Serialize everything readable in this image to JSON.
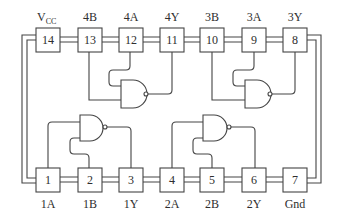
{
  "diagram": {
    "colors": {
      "line": "#444444",
      "text": "#2e2e2e",
      "background": "#ffffff"
    },
    "top_pins": [
      {
        "number": "14",
        "label": "V",
        "label_sub": "CC"
      },
      {
        "number": "13",
        "label": "4B"
      },
      {
        "number": "12",
        "label": "4A"
      },
      {
        "number": "11",
        "label": "4Y"
      },
      {
        "number": "10",
        "label": "3B"
      },
      {
        "number": "9",
        "label": "3A"
      },
      {
        "number": "8",
        "label": "3Y"
      }
    ],
    "bottom_pins": [
      {
        "number": "1",
        "label": "1A"
      },
      {
        "number": "2",
        "label": "1B"
      },
      {
        "number": "3",
        "label": "1Y"
      },
      {
        "number": "4",
        "label": "2A"
      },
      {
        "number": "5",
        "label": "2B"
      },
      {
        "number": "6",
        "label": "2Y"
      },
      {
        "number": "7",
        "label": "Gnd"
      }
    ],
    "gates": [
      {
        "name": "gate-1",
        "type": "NAND",
        "inputs": [
          "1",
          "2"
        ],
        "output": "3"
      },
      {
        "name": "gate-2",
        "type": "NAND",
        "inputs": [
          "4",
          "5"
        ],
        "output": "6"
      },
      {
        "name": "gate-3",
        "type": "NAND",
        "inputs": [
          "9",
          "10"
        ],
        "output": "8"
      },
      {
        "name": "gate-4",
        "type": "NAND",
        "inputs": [
          "12",
          "13"
        ],
        "output": "11"
      }
    ]
  }
}
